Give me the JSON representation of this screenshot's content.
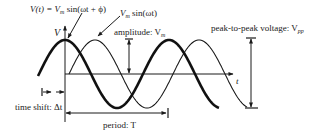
{
  "diagram": {
    "type": "sinusoid-parameters",
    "colors": {
      "ink": "#1a1a1a",
      "background": "#ffffff"
    },
    "labels": {
      "shifted_wave_eq": "V(t) = V",
      "shifted_wave_sub": "m",
      "shifted_wave_tail": " sin(ωt + ϕ)",
      "reference_wave_head": "V",
      "reference_wave_sub": "m",
      "reference_wave_tail": " sin(ωt)",
      "y_axis": "V",
      "x_axis": "t",
      "amplitude": "amplitude: V",
      "amplitude_sub": "m",
      "peak_to_peak": "peak-to-peak voltage: V",
      "peak_to_peak_sub": "pp",
      "time_shift": "time shift: Δt",
      "period": "period: T"
    },
    "curves": [
      {
        "name": "shifted-wave",
        "expression": "Vm sin(ωt + ϕ)",
        "style": "thick"
      },
      {
        "name": "reference-wave",
        "expression": "Vm sin(ωt)",
        "style": "thin"
      }
    ]
  }
}
